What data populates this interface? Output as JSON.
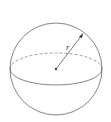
{
  "diagram": {
    "shape": "sphere",
    "radius_label": "r",
    "stroke_color": "#555555",
    "center": [
      56,
      69
    ],
    "radius": 46
  }
}
